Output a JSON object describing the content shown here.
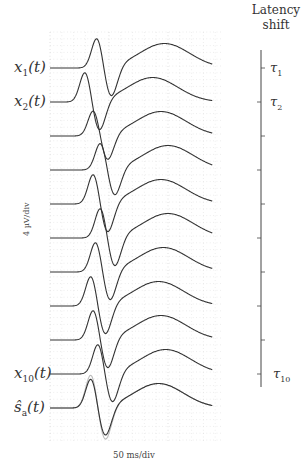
{
  "chart_data": {
    "type": "line",
    "title": "",
    "xlabel": "50 ms/div",
    "ylabel": "4 µV/div",
    "grid": true,
    "grid_style": "dotted",
    "series": [
      {
        "name": "x1(t)",
        "label_main": "x",
        "label_sub": "1",
        "latency_shift_ms": 5,
        "peak_scale": 1.0
      },
      {
        "name": "x2(t)",
        "label_main": "x",
        "label_sub": "2",
        "latency_shift_ms": -5,
        "peak_scale": 1.0
      },
      {
        "name": "x3(t)",
        "label_main": "",
        "label_sub": "",
        "latency_shift_ms": 2,
        "peak_scale": 0.85
      },
      {
        "name": "x4(t)",
        "label_main": "",
        "label_sub": "",
        "latency_shift_ms": 8,
        "peak_scale": 0.9
      },
      {
        "name": "x5(t)",
        "label_main": "",
        "label_sub": "",
        "latency_shift_ms": 2,
        "peak_scale": 1.0
      },
      {
        "name": "x6(t)",
        "label_main": "",
        "label_sub": "",
        "latency_shift_ms": 8,
        "peak_scale": 1.0
      },
      {
        "name": "x7(t)",
        "label_main": "",
        "label_sub": "",
        "latency_shift_ms": 4,
        "peak_scale": 1.0
      },
      {
        "name": "x8(t)",
        "label_main": "",
        "label_sub": "",
        "latency_shift_ms": 0,
        "peak_scale": 1.0
      },
      {
        "name": "x9(t)",
        "label_main": "",
        "label_sub": "",
        "latency_shift_ms": 2,
        "peak_scale": 1.0
      },
      {
        "name": "x10(t)",
        "label_main": "x",
        "label_sub": "10",
        "latency_shift_ms": 6,
        "peak_scale": 1.0
      }
    ],
    "template": {
      "name": "ŝa(t)",
      "label_main": "ŝ",
      "label_sub": "a",
      "true_template_color": "#bbbbbb",
      "estimate_color": "#333333"
    },
    "latency_axis": {
      "title_line1": "Latency",
      "title_line2": "shift",
      "tick_labels": [
        {
          "index": 1,
          "main": "τ",
          "sub": "1"
        },
        {
          "index": 2,
          "main": "τ",
          "sub": "2"
        },
        {
          "index": 10,
          "main": "τ",
          "sub": "10"
        }
      ],
      "tick_sides": [
        "right",
        "left",
        "right",
        "left",
        "right",
        "left",
        "right",
        "left",
        "right",
        "left"
      ]
    },
    "colors": {
      "trace": "#333333",
      "grid": "#c8c8c8",
      "axis": "#444444",
      "template_true": "#bbbbbb"
    }
  },
  "labels": {
    "x1": {
      "main": "x",
      "sub": "1",
      "arg": "(t)"
    },
    "x2": {
      "main": "x",
      "sub": "2",
      "arg": "(t)"
    },
    "x10": {
      "main": "x",
      "sub": "10",
      "arg": "(t)"
    },
    "sa": {
      "main": "ŝ",
      "sub": "a",
      "arg": "(t)"
    }
  },
  "axis": {
    "title_line1": "Latency",
    "title_line2": "shift",
    "tau1": {
      "main": "τ",
      "sub": "1"
    },
    "tau2": {
      "main": "τ",
      "sub": "2"
    },
    "tau10": {
      "main": "τ",
      "sub": "10"
    },
    "ylabel": "4 µV/div",
    "xlabel": "50 ms/div"
  }
}
